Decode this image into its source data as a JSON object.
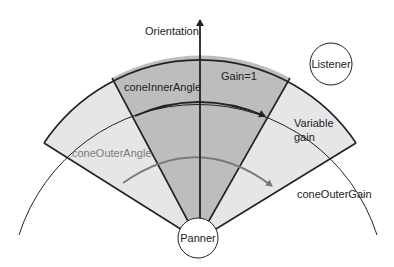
{
  "diagram": {
    "labels": {
      "orientation": "Orientation",
      "gain_one": "Gain=1",
      "cone_inner_angle": "coneInnerAngle",
      "cone_outer_angle": "coneOuterAngle",
      "variable_gain_line1": "Variable",
      "variable_gain_line2": "gain",
      "cone_outer_gain": "coneOuterGain",
      "listener": "Listener",
      "panner": "Panner"
    },
    "colors": {
      "inner_cone_fill": "#bdbdbd",
      "outer_cone_fill": "#e6e6e6",
      "line": "#222222",
      "outer_arrow": "#7a7a7a"
    }
  }
}
